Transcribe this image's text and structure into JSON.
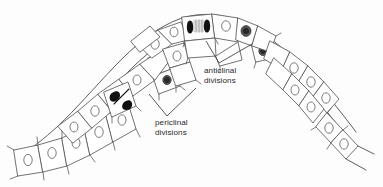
{
  "figure": {
    "type": "biological-line-drawing",
    "background_color": "#fdfdfd",
    "line_color": "#585858",
    "text_color": "#2b2b2b",
    "width": 383,
    "height": 187
  },
  "labels": {
    "anticlinal": {
      "line1": "anticlinal",
      "line2": "divisions"
    },
    "periclinal": {
      "line1": "periclinal",
      "line2": "divisions"
    }
  },
  "annotations": {
    "anticlinal_targets": 2,
    "periclinal_targets": 2,
    "dividing_cells": [
      {
        "name": "apex-mitotic-cell",
        "stage": "anaphase-with-spindle"
      },
      {
        "name": "left-periclinal-cell",
        "stage": "telophase-with-cell-plate"
      }
    ],
    "dark_nuclei_cells": 4
  }
}
